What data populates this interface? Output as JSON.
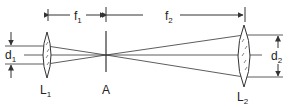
{
  "diagram": {
    "type": "optical-beam-expander",
    "colors": {
      "line": "#333333",
      "background": "#ffffff"
    },
    "labels": {
      "f1": "f",
      "f1_sub": "1",
      "f2": "f",
      "f2_sub": "2",
      "d1": "d",
      "d1_sub": "1",
      "d2": "d",
      "d2_sub": "2",
      "lens1": "L",
      "lens1_sub": "1",
      "aperture": "A",
      "lens2": "L",
      "lens2_sub": "2"
    },
    "components": [
      {
        "id": "L1",
        "kind": "converging-lens",
        "role": "first lens"
      },
      {
        "id": "A",
        "kind": "aperture",
        "role": "common focal point / pinhole"
      },
      {
        "id": "L2",
        "kind": "converging-lens",
        "role": "second lens"
      }
    ],
    "dimensions": [
      {
        "id": "f1",
        "between": [
          "L1",
          "A"
        ]
      },
      {
        "id": "f2",
        "between": [
          "A",
          "L2"
        ]
      },
      {
        "id": "d1",
        "meaning": "input beam diameter"
      },
      {
        "id": "d2",
        "meaning": "output beam diameter"
      }
    ]
  }
}
